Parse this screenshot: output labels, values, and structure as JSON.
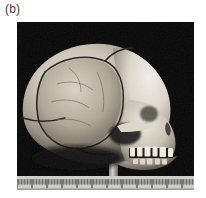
{
  "figure": {
    "panel_label": "(b)",
    "background_color": "#ffffff",
    "photo": {
      "alt_name": "skull-lateral-photograph",
      "background_color": "#050505",
      "orientation": "lateral view, facing right",
      "subject": "hominin cranium with mandible",
      "bone_highlight_color": "#e8e4da",
      "bone_midtone_color": "#b9b3a6",
      "bone_shadow_color": "#6e675c",
      "suture_color": "#2b2722",
      "features": [
        "cranial vault",
        "parietal bone fragment outlined by suture",
        "occipital region",
        "zygomatic arch",
        "orbit",
        "nasal aperture",
        "maxillary dentition",
        "mandible",
        "supporting mount post"
      ]
    },
    "scale_bar": {
      "name": "ruler",
      "type": "millimetre ruler",
      "face_color": "#cfcdc8",
      "tick_color": "#2f2d2a",
      "minor_ticks": 118,
      "major_tick_every": 10
    }
  }
}
